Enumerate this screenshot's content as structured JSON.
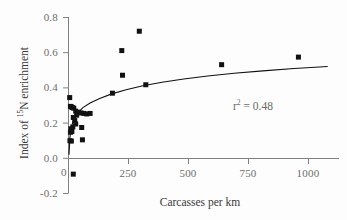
{
  "chart_data": {
    "type": "scatter",
    "title": "",
    "xlabel": "Carcasses per km",
    "ylabel": "Index of 15N enrichment",
    "ylabel_prefix": "Index of ",
    "ylabel_superscript": "15",
    "ylabel_suffix": "N enrichment",
    "xlim": [
      0,
      1125
    ],
    "ylim": [
      -0.2,
      0.8
    ],
    "xticks": [
      0,
      250,
      500,
      750,
      1000
    ],
    "xtick_labels": [
      "0",
      "250",
      "500",
      "750",
      "1000"
    ],
    "yticks": [
      -0.2,
      0.0,
      0.2,
      0.4,
      0.6,
      0.8
    ],
    "ytick_labels": [
      "-0.2",
      "0.0",
      "0.2",
      "0.4",
      "0.6",
      "0.8"
    ],
    "grid": false,
    "legend": null,
    "annotations": [
      {
        "name": "r-squared",
        "text_prefix": "r",
        "text_superscript": "2",
        "text_suffix": " = 0.48",
        "full_text": "r2 = 0.48",
        "x": 700,
        "y": 0.33
      }
    ],
    "marker": {
      "shape": "square",
      "color": "#111111",
      "size_px": 5
    },
    "points": [
      {
        "x": 5,
        "y": 0.345
      },
      {
        "x": 8,
        "y": 0.295
      },
      {
        "x": 12,
        "y": 0.292
      },
      {
        "x": 16,
        "y": 0.288
      },
      {
        "x": 22,
        "y": 0.285
      },
      {
        "x": 30,
        "y": 0.268
      },
      {
        "x": 40,
        "y": 0.262
      },
      {
        "x": 52,
        "y": 0.258
      },
      {
        "x": 64,
        "y": 0.255
      },
      {
        "x": 76,
        "y": 0.252
      },
      {
        "x": 90,
        "y": 0.255
      },
      {
        "x": 34,
        "y": 0.245
      },
      {
        "x": 20,
        "y": 0.232
      },
      {
        "x": 26,
        "y": 0.215
      },
      {
        "x": 30,
        "y": 0.195
      },
      {
        "x": 18,
        "y": 0.178
      },
      {
        "x": 55,
        "y": 0.175
      },
      {
        "x": 10,
        "y": 0.168
      },
      {
        "x": 14,
        "y": 0.152
      },
      {
        "x": 8,
        "y": 0.148
      },
      {
        "x": 6,
        "y": 0.1
      },
      {
        "x": 12,
        "y": 0.098
      },
      {
        "x": 58,
        "y": 0.105
      },
      {
        "x": 20,
        "y": -0.09
      },
      {
        "x": 183,
        "y": 0.37
      },
      {
        "x": 222,
        "y": 0.612
      },
      {
        "x": 225,
        "y": 0.472
      },
      {
        "x": 295,
        "y": 0.722
      },
      {
        "x": 322,
        "y": 0.418
      },
      {
        "x": 638,
        "y": 0.532
      },
      {
        "x": 958,
        "y": 0.575
      }
    ],
    "fit_curve": {
      "name": "logarithmic-fit",
      "description": "log fit line through scatter",
      "color": "#111111",
      "points": [
        {
          "x": 2,
          "y": 0.02
        },
        {
          "x": 6,
          "y": 0.12
        },
        {
          "x": 12,
          "y": 0.178
        },
        {
          "x": 22,
          "y": 0.222
        },
        {
          "x": 38,
          "y": 0.258
        },
        {
          "x": 60,
          "y": 0.288
        },
        {
          "x": 90,
          "y": 0.314
        },
        {
          "x": 130,
          "y": 0.34
        },
        {
          "x": 180,
          "y": 0.366
        },
        {
          "x": 240,
          "y": 0.39
        },
        {
          "x": 310,
          "y": 0.412
        },
        {
          "x": 390,
          "y": 0.432
        },
        {
          "x": 480,
          "y": 0.451
        },
        {
          "x": 580,
          "y": 0.468
        },
        {
          "x": 690,
          "y": 0.483
        },
        {
          "x": 810,
          "y": 0.497
        },
        {
          "x": 940,
          "y": 0.51
        },
        {
          "x": 1080,
          "y": 0.522
        }
      ]
    },
    "axis_color": "#808080",
    "background_color": "#fdfdfd",
    "origin_label": "0"
  }
}
